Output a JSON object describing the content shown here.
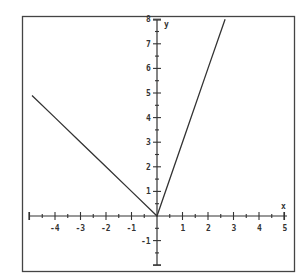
{
  "chart_data": {
    "type": "line",
    "title": "",
    "xlabel": "x",
    "ylabel": "y",
    "xlim": [
      -5,
      5
    ],
    "ylim": [
      -2,
      8
    ],
    "grid": false,
    "x_ticks": [
      -4,
      -3,
      -2,
      -1,
      1,
      2,
      3,
      4,
      5
    ],
    "y_ticks": [
      -1,
      1,
      2,
      3,
      4,
      5,
      6,
      7,
      8
    ],
    "series": [
      {
        "name": "piecewise f(x)",
        "description": "y = -x for x <= 0; y = 3x for x >= 0",
        "x": [
          -5,
          -4,
          -3,
          -2,
          -1,
          0,
          1,
          2,
          2.67
        ],
        "y": [
          5,
          4,
          3,
          2,
          1,
          0,
          3,
          6,
          8
        ]
      }
    ]
  },
  "labels": {
    "x_axis": "x",
    "y_axis": "y",
    "x_ticks": [
      "-4",
      "-3",
      "-2",
      "-1",
      "1",
      "2",
      "3",
      "4",
      "5"
    ],
    "y_ticks": [
      "-1",
      "1",
      "2",
      "3",
      "4",
      "5",
      "6",
      "7",
      "8"
    ]
  }
}
